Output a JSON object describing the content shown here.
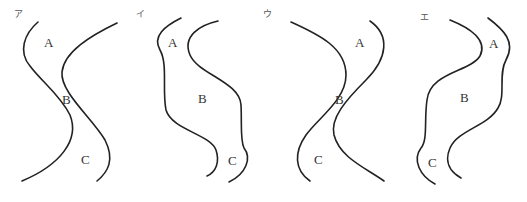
{
  "panels": [
    {
      "option": "ア",
      "labels": {
        "A": "A",
        "B": "B",
        "C": "C"
      },
      "left_curve": "M38,22 C24,34 18,52 30,66 C42,82 60,95 70,115 C80,140 60,165 22,181",
      "right_curve": "M117,23 C90,36 64,52 62,72 C60,92 92,118 105,140 C115,160 108,172 97,181"
    },
    {
      "option": "イ",
      "labels": {
        "A": "A",
        "B": "B",
        "C": "C"
      },
      "left_curve": "M181,18 C165,26 152,36 160,50 C168,64 162,90 166,110 C172,130 210,134 216,150 C220,162 216,172 207,176",
      "right_curve": "M218,21 C200,25 182,36 190,55 C198,74 240,82 241,105 C242,125 240,140 244,148 C252,158 246,174 229,182"
    },
    {
      "option": "ウ",
      "labels": {
        "A": "A",
        "B": "B",
        "C": "C"
      },
      "left_curve": "M291,22 C320,35 346,48 346,75 C346,100 318,118 306,135 C294,152 294,170 310,181",
      "right_curve": "M370,21 C390,35 388,58 366,80 C346,100 330,118 334,135 C340,158 366,168 384,181"
    },
    {
      "option": "エ",
      "labels": {
        "A": "A",
        "B": "B",
        "C": "C"
      },
      "left_curve": "M450,20 C470,28 488,40 480,56 C470,72 430,72 427,100 C424,120 428,140 421,148 C412,160 420,176 435,184",
      "right_curve": "M488,18 C504,30 516,42 506,60 C498,74 506,96 498,108 C488,126 458,130 450,148 C444,162 450,172 461,178"
    }
  ],
  "label_positions": [
    {
      "opt": [
        14,
        17
      ],
      "A": [
        44,
        47
      ],
      "B": [
        62,
        104
      ],
      "C": [
        81,
        164
      ]
    },
    {
      "opt": [
        136,
        17
      ],
      "A": [
        168,
        47
      ],
      "B": [
        198,
        103
      ],
      "C": [
        228,
        165
      ]
    },
    {
      "opt": [
        263,
        17
      ],
      "A": [
        355,
        47
      ],
      "B": [
        335,
        104
      ],
      "C": [
        314,
        164
      ]
    },
    {
      "opt": [
        420,
        20
      ],
      "A": [
        489,
        48
      ],
      "B": [
        460,
        102
      ],
      "C": [
        428,
        167
      ]
    }
  ]
}
